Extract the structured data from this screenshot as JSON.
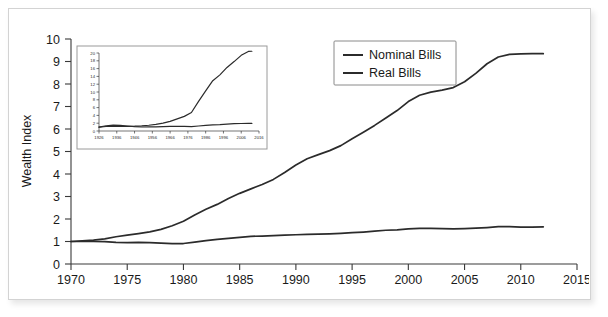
{
  "figure": {
    "name": "wealth-index-chart",
    "frame_border_color": "#d3d3d3",
    "background_color": "#ffffff",
    "line_color": "#2b2b2b"
  },
  "chart_data": {
    "type": "line",
    "title": "",
    "xlabel": "",
    "ylabel": "Wealth Index",
    "xlim": [
      1970,
      2015
    ],
    "ylim": [
      0,
      10
    ],
    "xticks": [
      1970,
      1975,
      1980,
      1985,
      1990,
      1995,
      2000,
      2005,
      2010,
      2015
    ],
    "yticks": [
      0,
      1,
      2,
      3,
      4,
      5,
      6,
      7,
      8,
      9,
      10
    ],
    "grid": false,
    "legend_position": "top-right",
    "legend": [
      "Nominal Bills",
      "Real Bills"
    ],
    "x": [
      1970,
      1971,
      1972,
      1973,
      1974,
      1975,
      1976,
      1977,
      1978,
      1979,
      1980,
      1981,
      1982,
      1983,
      1984,
      1985,
      1986,
      1987,
      1988,
      1989,
      1990,
      1991,
      1992,
      1993,
      1994,
      1995,
      1996,
      1997,
      1998,
      1999,
      2000,
      2001,
      2002,
      2003,
      2004,
      2005,
      2006,
      2007,
      2008,
      2009,
      2010,
      2011,
      2012
    ],
    "series": [
      {
        "name": "Nominal Bills",
        "values": [
          1.0,
          1.03,
          1.06,
          1.12,
          1.21,
          1.28,
          1.35,
          1.43,
          1.54,
          1.7,
          1.9,
          2.18,
          2.43,
          2.65,
          2.91,
          3.14,
          3.34,
          3.53,
          3.76,
          4.07,
          4.4,
          4.68,
          4.86,
          5.04,
          5.26,
          5.57,
          5.86,
          6.16,
          6.49,
          6.82,
          7.22,
          7.5,
          7.64,
          7.73,
          7.84,
          8.1,
          8.47,
          8.9,
          9.2,
          9.32,
          9.34,
          9.35,
          9.35
        ]
      },
      {
        "name": "Real Bills",
        "values": [
          1.0,
          1.0,
          1.0,
          0.99,
          0.96,
          0.95,
          0.96,
          0.95,
          0.93,
          0.91,
          0.91,
          0.97,
          1.04,
          1.09,
          1.14,
          1.18,
          1.23,
          1.24,
          1.26,
          1.28,
          1.3,
          1.32,
          1.33,
          1.34,
          1.36,
          1.39,
          1.42,
          1.46,
          1.5,
          1.52,
          1.56,
          1.58,
          1.58,
          1.57,
          1.56,
          1.57,
          1.59,
          1.62,
          1.66,
          1.66,
          1.64,
          1.64,
          1.65
        ]
      }
    ],
    "inset": {
      "type": "line",
      "xlim": [
        1926,
        2016
      ],
      "ylim": [
        0,
        20
      ],
      "xticks": [
        1926,
        1936,
        1946,
        1956,
        1966,
        1976,
        1986,
        1996,
        2006,
        2016
      ],
      "yticks": [
        0,
        2,
        4,
        6,
        8,
        10,
        12,
        14,
        16,
        18,
        20
      ],
      "grid": false,
      "x": [
        1926,
        1930,
        1934,
        1938,
        1942,
        1946,
        1950,
        1954,
        1958,
        1962,
        1966,
        1970,
        1974,
        1978,
        1982,
        1986,
        1990,
        1994,
        1998,
        2002,
        2006,
        2010,
        2012
      ],
      "series": [
        {
          "name": "Nominal Bills",
          "values": [
            1.0,
            1.15,
            1.18,
            1.2,
            1.21,
            1.24,
            1.32,
            1.48,
            1.7,
            2.0,
            2.45,
            3.1,
            3.75,
            4.75,
            7.6,
            10.3,
            12.9,
            14.4,
            16.3,
            17.8,
            19.4,
            20.4,
            20.45
          ]
        },
        {
          "name": "Real Bills",
          "values": [
            1.0,
            1.35,
            1.5,
            1.42,
            1.28,
            1.1,
            1.02,
            1.05,
            1.08,
            1.12,
            1.18,
            1.22,
            1.18,
            1.14,
            1.28,
            1.45,
            1.55,
            1.62,
            1.76,
            1.88,
            1.92,
            1.94,
            1.95
          ]
        }
      ]
    }
  }
}
